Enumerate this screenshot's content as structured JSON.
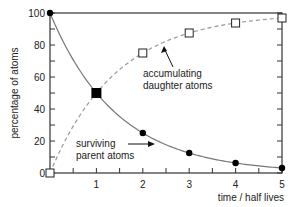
{
  "chart_data": {
    "type": "line",
    "title": "",
    "xlabel": "time / half lives",
    "ylabel": "percentage of atoms",
    "xlim": [
      0,
      5
    ],
    "ylim": [
      0,
      100
    ],
    "x_ticks": [
      "1",
      "2",
      "3",
      "4",
      "5"
    ],
    "y_ticks": [
      "0",
      "20",
      "40",
      "60",
      "80",
      "100"
    ],
    "grid": false,
    "x": [
      0,
      1,
      2,
      3,
      4,
      5
    ],
    "series": [
      {
        "name": "surviving parent atoms",
        "style": "solid line, filled circle markers",
        "values": [
          100,
          50,
          25,
          12.5,
          6.25,
          3.125
        ]
      },
      {
        "name": "accumulating daughter atoms",
        "style": "dashed line, open square markers",
        "values": [
          0,
          50,
          75,
          87.5,
          93.75,
          96.875
        ]
      }
    ],
    "annotations": [
      {
        "text_lines": [
          "accumulating",
          "daughter atoms"
        ],
        "arrow_to": "daughter curve"
      },
      {
        "text_lines": [
          "surviving",
          "parent atoms"
        ],
        "arrow_to": "parent curve"
      }
    ],
    "intersection_marker": {
      "x": 1,
      "y": 50,
      "style": "filled square"
    }
  },
  "colors": {
    "axis": "#333333",
    "parent_line": "#777777",
    "daughter_line": "#999999",
    "marker": "#000000"
  }
}
